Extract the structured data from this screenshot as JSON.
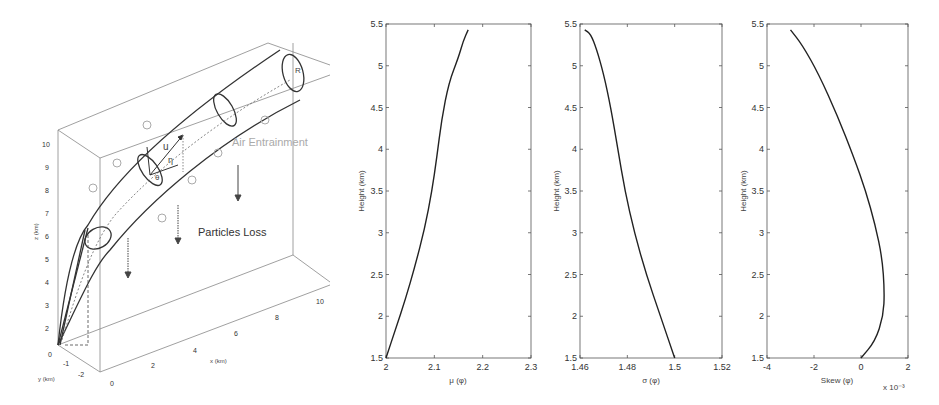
{
  "diagram": {
    "labels": {
      "air_entrainment": "Air Entrainment",
      "particles_loss": "Particles Loss",
      "u": "u",
      "eta": "η",
      "theta": "θ",
      "R": "R"
    },
    "axes": {
      "z_label": "z (km)",
      "y_label": "y (km)",
      "x_label": "x (km)",
      "z_ticks": [
        "0",
        "2",
        "3",
        "4",
        "5",
        "6",
        "7",
        "8",
        "9",
        "10"
      ],
      "y_ticks": [
        "-1",
        "-2"
      ],
      "x_ticks": [
        "0",
        "2",
        "4",
        "6",
        "8",
        "10"
      ]
    }
  },
  "chart_data": [
    {
      "type": "line",
      "title": "",
      "xlabel": "μ (φ)",
      "ylabel": "Height (km)",
      "xlim": [
        2,
        2.3
      ],
      "ylim": [
        1.5,
        5.5
      ],
      "xticks": [
        "2",
        "2.1",
        "2.2",
        "2.3"
      ],
      "yticks": [
        "1.5",
        "2",
        "2.5",
        "3",
        "3.5",
        "4",
        "4.5",
        "5",
        "5.5"
      ],
      "grid": false,
      "x": [
        2.0,
        2.02,
        2.04,
        2.06,
        2.08,
        2.095,
        2.105,
        2.115,
        2.13,
        2.15,
        2.16,
        2.17
      ],
      "y": [
        1.5,
        1.85,
        2.2,
        2.6,
        3.05,
        3.5,
        3.9,
        4.35,
        4.8,
        5.1,
        5.3,
        5.43
      ]
    },
    {
      "type": "line",
      "title": "",
      "xlabel": "σ (φ)",
      "ylabel": "Height (km)",
      "xlim": [
        1.46,
        1.52
      ],
      "ylim": [
        1.5,
        5.5
      ],
      "xticks": [
        "1.46",
        "1.48",
        "1.5",
        "1.52"
      ],
      "yticks": [
        "1.5",
        "2",
        "2.5",
        "3",
        "3.5",
        "4",
        "4.5",
        "5",
        "5.5"
      ],
      "grid": false,
      "x": [
        1.5,
        1.494,
        1.488,
        1.483,
        1.479,
        1.476,
        1.473,
        1.47,
        1.467,
        1.4645,
        1.462
      ],
      "y": [
        1.5,
        2.0,
        2.5,
        3.0,
        3.5,
        4.0,
        4.5,
        4.9,
        5.2,
        5.38,
        5.43
      ]
    },
    {
      "type": "line",
      "title": "",
      "xlabel": "Skew (φ)",
      "ylabel": "Height (km)",
      "xlim": [
        -4,
        2
      ],
      "ylim": [
        1.5,
        5.5
      ],
      "xticks": [
        "-4",
        "-2",
        "0",
        "2"
      ],
      "yticks": [
        "1.5",
        "2",
        "2.5",
        "3",
        "3.5",
        "4",
        "4.5",
        "5",
        "5.5"
      ],
      "x_multiplier": "x 10⁻³",
      "grid": false,
      "x": [
        0.0,
        0.6,
        0.95,
        1.0,
        0.9,
        0.6,
        0.2,
        -0.3,
        -1.0,
        -1.8,
        -2.5,
        -3.0
      ],
      "y": [
        1.5,
        1.7,
        2.0,
        2.3,
        2.7,
        3.1,
        3.5,
        3.9,
        4.4,
        4.9,
        5.25,
        5.43
      ]
    }
  ]
}
